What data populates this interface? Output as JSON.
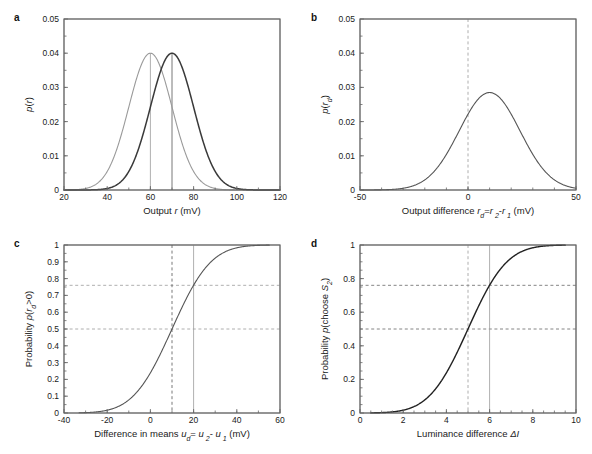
{
  "figure": {
    "background": "#ffffff",
    "axis_color": "#666666",
    "text_color": "#1a1a1a"
  },
  "panels": [
    {
      "letter": "a",
      "id": "panel-a",
      "xlabel_parts": [
        {
          "t": "Output ",
          "i": false
        },
        {
          "t": "r",
          "i": true
        },
        {
          "t": " (mV)",
          "i": false
        }
      ],
      "ylabel_parts": [
        {
          "t": "p",
          "i": true
        },
        {
          "t": "(",
          "i": false
        },
        {
          "t": "r",
          "i": true
        },
        {
          "t": ")",
          "i": false
        }
      ]
    },
    {
      "letter": "b",
      "id": "panel-b",
      "xlabel_parts": [
        {
          "t": "Output difference  ",
          "i": false
        },
        {
          "t": "r",
          "i": true
        },
        {
          "t": "d",
          "i": true,
          "sub": true
        },
        {
          "t": "=",
          "i": false
        },
        {
          "t": "r",
          "i": true
        },
        {
          "t": " 2",
          "i": true,
          "sub": true
        },
        {
          "t": "-",
          "i": false
        },
        {
          "t": "r",
          "i": true
        },
        {
          "t": " 1",
          "i": true,
          "sub": true
        },
        {
          "t": " (mV)",
          "i": false
        }
      ],
      "ylabel_parts": [
        {
          "t": "p",
          "i": true
        },
        {
          "t": "(",
          "i": false
        },
        {
          "t": "r",
          "i": true
        },
        {
          "t": "d",
          "i": true,
          "sub": true
        },
        {
          "t": ")",
          "i": false
        }
      ]
    },
    {
      "letter": "c",
      "id": "panel-c",
      "xlabel_parts": [
        {
          "t": "Difference in means  ",
          "i": false
        },
        {
          "t": "u",
          "i": true
        },
        {
          "t": "d",
          "i": true,
          "sub": true
        },
        {
          "t": "= ",
          "i": false
        },
        {
          "t": "u",
          "i": true
        },
        {
          "t": " 2",
          "i": true,
          "sub": true
        },
        {
          "t": "- ",
          "i": false
        },
        {
          "t": "u",
          "i": true
        },
        {
          "t": " 1",
          "i": true,
          "sub": true
        },
        {
          "t": " (mV)",
          "i": false
        }
      ],
      "ylabel_parts": [
        {
          "t": "Probability ",
          "i": false
        },
        {
          "t": "p",
          "i": true
        },
        {
          "t": "(",
          "i": false
        },
        {
          "t": "r",
          "i": true
        },
        {
          "t": "d",
          "i": true,
          "sub": true
        },
        {
          "t": ">0)",
          "i": false
        }
      ]
    },
    {
      "letter": "d",
      "id": "panel-d",
      "xlabel_parts": [
        {
          "t": "Luminance difference ",
          "i": false
        },
        {
          "t": "ΔI",
          "i": true
        }
      ],
      "ylabel_parts": [
        {
          "t": "Probability ",
          "i": false
        },
        {
          "t": "p",
          "i": true
        },
        {
          "t": "(choose ",
          "i": false
        },
        {
          "t": "S",
          "i": true
        },
        {
          "t": "2",
          "i": true,
          "sub": true
        },
        {
          "t": ")",
          "i": false
        }
      ]
    }
  ],
  "chart_data": [
    {
      "id": "panel-a",
      "type": "line",
      "title": "",
      "xlabel": "Output r (mV)",
      "ylabel": "p(r)",
      "xlim": [
        20,
        120
      ],
      "ylim": [
        0,
        0.05
      ],
      "xticks": [
        20,
        40,
        60,
        80,
        100,
        120
      ],
      "xticklabels": [
        "20",
        "40",
        "60",
        "80",
        "100",
        "120"
      ],
      "yticks": [
        0,
        0.01,
        0.02,
        0.03,
        0.04,
        0.05
      ],
      "yticklabels": [
        "0",
        "0.01",
        "0.02",
        "0.03",
        "0.04",
        "0.05"
      ],
      "minor_x_step": 10,
      "minor_y_step": 0.005,
      "grid": false,
      "legend": "none",
      "series": [
        {
          "name": "distribution 1",
          "kind": "gaussian",
          "mean": 60,
          "sigma": 10,
          "peak": 0.04,
          "color": "#9a9a9a",
          "width": 1.1
        },
        {
          "name": "distribution 2",
          "kind": "gaussian",
          "mean": 70,
          "sigma": 10,
          "peak": 0.04,
          "color": "#3a3a3a",
          "width": 1.5
        }
      ],
      "vlines": [
        {
          "x": 60,
          "color": "#9a9a9a",
          "style": "solid",
          "ymax": 0.04
        },
        {
          "x": 70,
          "color": "#555555",
          "style": "solid",
          "ymax": 0.04
        }
      ],
      "hlines": []
    },
    {
      "id": "panel-b",
      "type": "line",
      "title": "",
      "xlabel": "Output difference r_d=r_2-r_1 (mV)",
      "ylabel": "p(r_d)",
      "xlim": [
        -50,
        50
      ],
      "ylim": [
        0,
        0.05
      ],
      "xticks": [
        -50,
        0,
        50
      ],
      "xticklabels": [
        "-50",
        "0",
        "50"
      ],
      "yticks": [
        0,
        0.01,
        0.02,
        0.03,
        0.04,
        0.05
      ],
      "yticklabels": [
        "0",
        "0.01",
        "0.02",
        "0.03",
        "0.04",
        "0.05"
      ],
      "minor_x_step": 10,
      "minor_y_step": 0.005,
      "grid": false,
      "legend": "none",
      "series": [
        {
          "name": "difference distribution",
          "kind": "gaussian",
          "mean": 10,
          "sigma": 14.1,
          "peak": 0.0285,
          "color": "#555555",
          "width": 1.1
        }
      ],
      "vlines": [
        {
          "x": 0,
          "color": "#9a9a9a",
          "style": "dashed",
          "ymax": 0.05
        }
      ],
      "hlines": []
    },
    {
      "id": "panel-c",
      "type": "line",
      "title": "",
      "xlabel": "Difference in means u_d= u_2- u_1 (mV)",
      "ylabel": "Probability p(r_d>0)",
      "xlim": [
        -40,
        60
      ],
      "ylim": [
        0,
        1
      ],
      "xticks": [
        -40,
        -20,
        0,
        20,
        40,
        60
      ],
      "xticklabels": [
        "-40",
        "-20",
        "0",
        "20",
        "40",
        "60"
      ],
      "yticks": [
        0,
        0.1,
        0.2,
        0.3,
        0.4,
        0.5,
        0.6,
        0.7,
        0.8,
        0.9,
        1
      ],
      "yticklabels": [
        "0",
        "0.1",
        "0.2",
        "0.3",
        "0.4",
        "0.5",
        "0.6",
        "0.7",
        "0.8",
        "0.9",
        "1"
      ],
      "minor_x_step": 10,
      "minor_y_step": 0.05,
      "grid": false,
      "legend": "none",
      "series": [
        {
          "name": "cumulative normal",
          "kind": "cdf",
          "mean": 10,
          "sigma": 14.1,
          "xstart": -33,
          "xend": 55,
          "color": "#555555",
          "width": 1.1
        }
      ],
      "vlines": [
        {
          "x": 10,
          "color": "#555555",
          "style": "dashed",
          "ymax": 1
        },
        {
          "x": 20,
          "color": "#9a9a9a",
          "style": "solid",
          "ymax": 1
        }
      ],
      "hlines": [
        {
          "y": 0.5,
          "color": "#9a9a9a",
          "style": "dashed"
        },
        {
          "y": 0.76,
          "color": "#9a9a9a",
          "style": "dashed"
        }
      ]
    },
    {
      "id": "panel-d",
      "type": "line",
      "title": "",
      "xlabel": "Luminance difference ΔI",
      "ylabel": "Probability p(choose S_2)",
      "xlim": [
        0,
        10
      ],
      "ylim": [
        0,
        1
      ],
      "xticks": [
        0,
        2,
        4,
        6,
        8,
        10
      ],
      "xticklabels": [
        "0",
        "2",
        "4",
        "6",
        "8",
        "10"
      ],
      "yticks": [
        0,
        0.2,
        0.4,
        0.6,
        0.8,
        1
      ],
      "yticklabels": [
        "0",
        "0.2",
        "0.4",
        "0.6",
        "0.8",
        "1"
      ],
      "minor_x_step": 0.5,
      "minor_y_step": 0.05,
      "grid": false,
      "legend": "none",
      "series": [
        {
          "name": "psychometric function",
          "kind": "cdf",
          "mean": 5,
          "sigma": 1.41,
          "xstart": 0.5,
          "xend": 9.5,
          "color": "#222222",
          "width": 1.4
        }
      ],
      "vlines": [
        {
          "x": 5,
          "color": "#9a9a9a",
          "style": "dashed",
          "ymax": 1
        },
        {
          "x": 6,
          "color": "#9a9a9a",
          "style": "solid",
          "ymax": 1
        }
      ],
      "hlines": [
        {
          "y": 0.5,
          "color": "#666666",
          "style": "dashed"
        },
        {
          "y": 0.76,
          "color": "#666666",
          "style": "dashed"
        }
      ]
    }
  ]
}
